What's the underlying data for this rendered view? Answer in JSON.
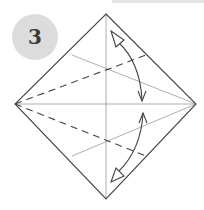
{
  "step": {
    "number": "3"
  },
  "colors": {
    "badge_fill": "#dcdcdc",
    "badge_text": "#3a3a3a",
    "outline": "#444444",
    "crease": "#999999",
    "valley_fold": "#444444",
    "arrow": "#444444"
  },
  "diagram": {
    "shape": "square-diamond",
    "vertices": {
      "top": [
        106,
        14
      ],
      "right": [
        196,
        104
      ],
      "bottom": [
        106,
        199
      ],
      "left": [
        15,
        104
      ]
    },
    "creases": [
      "vertical-center",
      "horizontal-center",
      "upper-diagonal-crease",
      "lower-diagonal-crease"
    ],
    "valley_folds": [
      "upper-dashed-fold",
      "lower-dashed-fold"
    ],
    "arrows": [
      "upper-fold-and-unfold-arrow",
      "lower-fold-and-unfold-arrow"
    ]
  }
}
